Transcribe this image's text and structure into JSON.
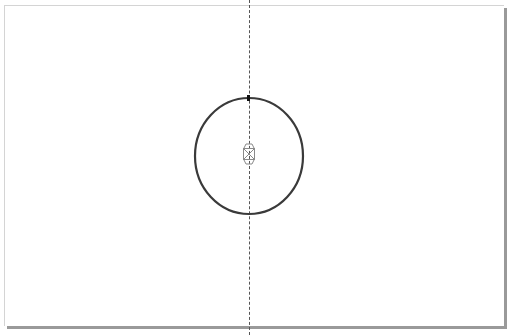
{
  "canvas": {
    "background": "#ffffff",
    "page": {
      "border_color": "#d4d4d4",
      "shadow_color": "#9a9a9a"
    },
    "guide": {
      "orientation": "vertical",
      "x": 249,
      "style": "dashed",
      "color": "#555555"
    },
    "shape": {
      "type": "ellipse",
      "cx": 249,
      "cy": 156,
      "rx": 54,
      "ry": 58,
      "stroke": "#3a3a3a",
      "fill": "none"
    },
    "center_marker": {
      "icon": "rotation-center-icon",
      "x": 249,
      "y": 155,
      "color": "#8a8a8a"
    },
    "node_marker": {
      "icon": "node-handle-icon",
      "x": 249,
      "y": 98
    }
  }
}
